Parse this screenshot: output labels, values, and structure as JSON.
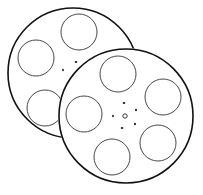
{
  "illustration": {
    "subject": "two film reels",
    "icon": "film-reel-icon",
    "colors": {
      "background": "#ffffff",
      "stroke": "#111111",
      "hole_stroke": "#333333"
    },
    "reels": [
      {
        "name": "back-reel",
        "hole_count": 3
      },
      {
        "name": "front-reel",
        "hole_count": 5
      }
    ]
  }
}
